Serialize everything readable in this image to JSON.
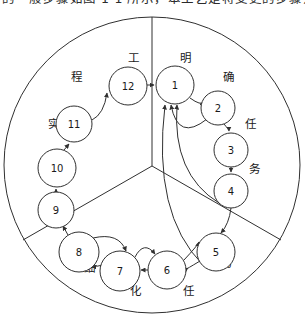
{
  "caption": {
    "text": "的一般步骤如图 1-1 所示，本工艺是将变更的步骤开"
  },
  "figure": {
    "frame": {
      "outer_circle": {
        "cx": 152,
        "cy": 151,
        "r": 148
      },
      "divider_kind": "y-shaped-three-sector",
      "divider_center": {
        "x": 152,
        "y": 152
      }
    },
    "sectors": [
      {
        "id": "sector-right",
        "name": "明确任务",
        "chars": [
          "明",
          "确",
          "任",
          "务"
        ]
      },
      {
        "id": "sector-bottom",
        "name": "细化任务",
        "chars": [
          "细",
          "化",
          "任",
          "务"
        ]
      },
      {
        "id": "sector-left",
        "name": "工程实施",
        "chars": [
          "工",
          "程",
          "实",
          "施"
        ]
      }
    ],
    "sector_char_labels": [
      {
        "char": "工",
        "x": 133,
        "y": 44
      },
      {
        "char": "明",
        "x": 185,
        "y": 44
      },
      {
        "char": "确",
        "x": 228,
        "y": 63
      },
      {
        "char": "任",
        "x": 250,
        "y": 110
      },
      {
        "char": "务",
        "x": 254,
        "y": 155
      },
      {
        "char": "务",
        "x": 226,
        "y": 249
      },
      {
        "char": "任",
        "x": 188,
        "y": 277
      },
      {
        "char": "化",
        "x": 135,
        "y": 277
      },
      {
        "char": "细",
        "x": 89,
        "y": 254
      },
      {
        "char": "施",
        "x": 52,
        "y": 155
      },
      {
        "char": "实",
        "x": 53,
        "y": 110
      },
      {
        "char": "程",
        "x": 76,
        "y": 63
      }
    ],
    "nodes": [
      {
        "id": 1,
        "label": "1",
        "cx": 175,
        "cy": 71,
        "r": 19
      },
      {
        "id": 2,
        "label": "2",
        "cx": 218,
        "cy": 94,
        "r": 17
      },
      {
        "id": 3,
        "label": "3",
        "cx": 231,
        "cy": 136,
        "r": 17
      },
      {
        "id": 4,
        "label": "4",
        "cx": 231,
        "cy": 177,
        "r": 17
      },
      {
        "id": 5,
        "label": "5",
        "cx": 216,
        "cy": 238,
        "r": 19
      },
      {
        "id": 6,
        "label": "6",
        "cx": 167,
        "cy": 256,
        "r": 19
      },
      {
        "id": 7,
        "label": "7",
        "cx": 120,
        "cy": 257,
        "r": 20
      },
      {
        "id": 8,
        "label": "8",
        "cx": 79,
        "cy": 238,
        "r": 20
      },
      {
        "id": 9,
        "label": "9",
        "cx": 56,
        "cy": 196,
        "r": 18
      },
      {
        "id": 10,
        "label": "10",
        "cx": 57,
        "cy": 154,
        "r": 19
      },
      {
        "id": 11,
        "label": "11",
        "cx": 74,
        "cy": 110,
        "r": 18
      },
      {
        "id": 12,
        "label": "12",
        "cx": 128,
        "cy": 72,
        "r": 19
      }
    ],
    "edges": [
      {
        "from": 12,
        "to": 1,
        "kind": "straight-arrow"
      },
      {
        "from": 1,
        "to": 2,
        "kind": "curved-arrow"
      },
      {
        "from": 2,
        "to": 3,
        "kind": "curved-arrow"
      },
      {
        "from": 3,
        "to": 4,
        "kind": "straight-arrow"
      },
      {
        "from": 4,
        "to": 5,
        "kind": "curved-arrow"
      },
      {
        "from": 5,
        "to": 6,
        "kind": "bidirectional-arc"
      },
      {
        "from": 6,
        "to": 7,
        "kind": "bidirectional-arc"
      },
      {
        "from": 7,
        "to": 8,
        "kind": "bidirectional-arc"
      },
      {
        "from": 8,
        "to": 9,
        "kind": "straight-arrow"
      },
      {
        "from": 9,
        "to": 10,
        "kind": "straight-arrow"
      },
      {
        "from": 10,
        "to": 11,
        "kind": "straight-arrow"
      },
      {
        "from": 11,
        "to": 12,
        "kind": "curved-arrow"
      },
      {
        "from": 2,
        "to": 1,
        "kind": "feedback-curve"
      },
      {
        "from": 4,
        "to": 1,
        "kind": "feedback-curve"
      },
      {
        "from": 5,
        "to": 1,
        "kind": "feedback-curve"
      }
    ]
  }
}
